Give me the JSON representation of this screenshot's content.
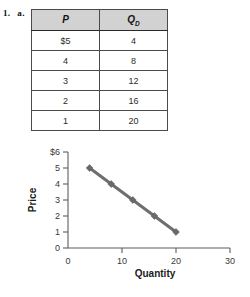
{
  "problem": {
    "number": "1.",
    "part": "a."
  },
  "table": {
    "name": "demand-schedule",
    "headers": [
      {
        "text": "P",
        "subscript": ""
      },
      {
        "text": "Q",
        "subscript": "D"
      }
    ],
    "rows": [
      {
        "price": "$5",
        "quantity": "4"
      },
      {
        "price": "4",
        "quantity": "8"
      },
      {
        "price": "3",
        "quantity": "12"
      },
      {
        "price": "2",
        "quantity": "16"
      },
      {
        "price": "1",
        "quantity": "20"
      }
    ]
  },
  "chart_data": {
    "type": "line",
    "title": "",
    "xlabel": "Quantity",
    "ylabel": "Price",
    "x": [
      4,
      8,
      12,
      16,
      20
    ],
    "values": [
      5,
      4,
      3,
      2,
      1
    ],
    "series": [
      {
        "name": "Demand",
        "values": [
          5,
          4,
          3,
          2,
          1
        ]
      }
    ],
    "xlim": [
      0,
      30
    ],
    "ylim": [
      0,
      6
    ],
    "xticks": [
      0,
      10,
      20,
      30
    ],
    "xtick_labels": [
      "0",
      "10",
      "20",
      "30"
    ],
    "yticks": [
      0,
      1,
      2,
      3,
      4,
      5,
      6
    ],
    "ytick_labels": [
      "0",
      "1",
      "2",
      "3",
      "4",
      "5",
      "$6"
    ],
    "grid": false,
    "legend": "none",
    "line_color": "#6e6e6e",
    "marker": "diamond",
    "marker_color": "#6a6a6a",
    "axis_color": "#5d5d5d"
  },
  "colors": {
    "header_fill": "#d2d2d2",
    "table_border": "#1d1d1d",
    "cell_border": "#4a4a4a",
    "text": "#2b2b2b",
    "background": "#ffffff"
  }
}
